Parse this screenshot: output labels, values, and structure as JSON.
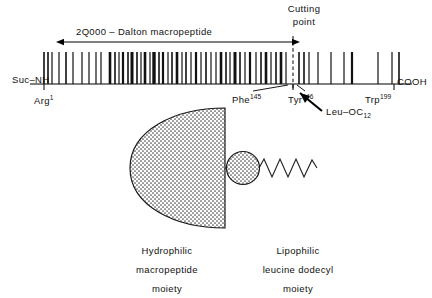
{
  "figure": {
    "kind": "peptide-schematic",
    "background": "#ffffff",
    "ink": "#000000"
  },
  "backbone": {
    "name": "peptide-backbone-line",
    "n_terminus_label": "Suc–NH",
    "c_terminus_label": "COOH",
    "residue_start_label": "Arg",
    "residue_start_superscript": "1",
    "residue_cut_left_label": "Phe",
    "residue_cut_left_superscript": "145",
    "residue_cut_right_label": "Tyr",
    "residue_cut_right_superscript": "146",
    "residue_end_label": "Trp",
    "residue_end_superscript": "199"
  },
  "annotations": {
    "span_label": "2Q000 – Dalton  macropeptide",
    "cutting_point_line1": "Cutting",
    "cutting_point_line2": "point",
    "cleavage_product_label": "Leu–OC",
    "cleavage_product_subscript": "12"
  },
  "captions": {
    "left": {
      "line1": "Hydrophilic",
      "line2": "macropeptide",
      "line3": "moiety"
    },
    "right": {
      "line1": "Lipophilic",
      "line2": "leucine  dodecyl",
      "line3": "moiety"
    }
  },
  "chart_data": {
    "type": "diagram",
    "axis": {
      "x_start_px": 30,
      "x_end_px": 412,
      "baseline_y_px": 84,
      "residue_index_start": 1,
      "residue_index_end": 199,
      "cut_between": [
        145,
        146
      ]
    },
    "span_arrow": {
      "label": "2Q000 – Dalton  macropeptide",
      "from_px": 64,
      "to_px": 293,
      "y_px": 42
    },
    "cut_line": {
      "x_px": 293,
      "style": "dashed",
      "from_y_px": 36,
      "to_y_px": 90
    },
    "residue_ticks": [
      {
        "x": 44,
        "w": 1.6
      },
      {
        "x": 48,
        "w": 1.6
      },
      {
        "x": 52,
        "w": 1.2
      },
      {
        "x": 59,
        "w": 1.2
      },
      {
        "x": 66,
        "w": 1.6
      },
      {
        "x": 73,
        "w": 1.2
      },
      {
        "x": 82,
        "w": 1.2
      },
      {
        "x": 89,
        "w": 1.2
      },
      {
        "x": 96,
        "w": 1.2
      },
      {
        "x": 101,
        "w": 1.2
      },
      {
        "x": 110,
        "w": 2.6
      },
      {
        "x": 115,
        "w": 1.6
      },
      {
        "x": 119,
        "w": 1.2
      },
      {
        "x": 123,
        "w": 2.2
      },
      {
        "x": 128,
        "w": 1.6
      },
      {
        "x": 132,
        "w": 3.0
      },
      {
        "x": 137,
        "w": 1.6
      },
      {
        "x": 141,
        "w": 1.2
      },
      {
        "x": 145,
        "w": 2.6
      },
      {
        "x": 150,
        "w": 1.2
      },
      {
        "x": 154,
        "w": 3.4
      },
      {
        "x": 159,
        "w": 1.6
      },
      {
        "x": 163,
        "w": 2.2
      },
      {
        "x": 168,
        "w": 1.2
      },
      {
        "x": 172,
        "w": 1.6
      },
      {
        "x": 177,
        "w": 2.6
      },
      {
        "x": 182,
        "w": 1.2
      },
      {
        "x": 186,
        "w": 1.6
      },
      {
        "x": 191,
        "w": 1.2
      },
      {
        "x": 196,
        "w": 2.2
      },
      {
        "x": 201,
        "w": 1.2
      },
      {
        "x": 206,
        "w": 1.6
      },
      {
        "x": 211,
        "w": 1.2
      },
      {
        "x": 216,
        "w": 1.2
      },
      {
        "x": 221,
        "w": 2.6
      },
      {
        "x": 226,
        "w": 1.6
      },
      {
        "x": 230,
        "w": 1.2
      },
      {
        "x": 235,
        "w": 3.0
      },
      {
        "x": 240,
        "w": 1.6
      },
      {
        "x": 245,
        "w": 1.2
      },
      {
        "x": 250,
        "w": 2.2
      },
      {
        "x": 256,
        "w": 1.2
      },
      {
        "x": 261,
        "w": 1.6
      },
      {
        "x": 266,
        "w": 2.6
      },
      {
        "x": 271,
        "w": 1.2
      },
      {
        "x": 276,
        "w": 1.6
      },
      {
        "x": 281,
        "w": 2.6
      },
      {
        "x": 286,
        "w": 1.2
      },
      {
        "x": 299,
        "w": 1.6
      },
      {
        "x": 304,
        "w": 1.6
      },
      {
        "x": 309,
        "w": 1.2
      },
      {
        "x": 318,
        "w": 1.2
      },
      {
        "x": 331,
        "w": 1.2
      },
      {
        "x": 344,
        "w": 1.2
      },
      {
        "x": 352,
        "w": 2.2
      },
      {
        "x": 378,
        "w": 1.2
      },
      {
        "x": 392,
        "w": 1.2
      },
      {
        "x": 399,
        "w": 1.6
      }
    ],
    "molecule_cartoon": {
      "macropeptide_blob": {
        "cx": 226,
        "cy": 168,
        "rx": 96,
        "ry": 60,
        "fill": "stippled",
        "shape": "half-disc-flat-right"
      },
      "leucine_head": {
        "cx": 243,
        "cy": 168,
        "r": 17,
        "fill": "stippled"
      },
      "dodecyl_tail": {
        "from_x": 260,
        "to_x": 313,
        "y": 168,
        "peaks": 6,
        "amplitude_px": 9
      }
    }
  }
}
